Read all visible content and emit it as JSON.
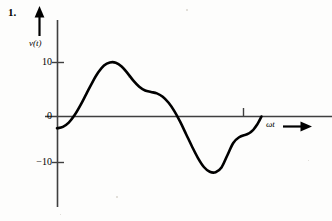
{
  "figure": {
    "problem_number": "1.",
    "y_axis_label": "v(t)",
    "x_axis_label": "ωt",
    "background_color": "#fdfdfc",
    "ink_color": "#000000",
    "axis_color": "#3a3a3a"
  },
  "ticks": {
    "y": [
      {
        "label": "10",
        "value": 10
      },
      {
        "label": "0",
        "value": 0
      },
      {
        "label": "−10",
        "value": -10
      }
    ],
    "x": [
      {
        "label": "",
        "value": 7.5
      }
    ]
  },
  "chart_data": {
    "type": "line",
    "title": "",
    "subtitle": "",
    "xlabel": "ωt",
    "ylabel": "v(t)",
    "xlim": [
      0,
      9.6
    ],
    "ylim": [
      -16,
      17
    ],
    "grid": false,
    "legend": null,
    "annotations": [
      {
        "text": "1.",
        "role": "problem-number"
      },
      {
        "text": "v(t)",
        "role": "y-axis-arrow-label"
      },
      {
        "text": "ωt",
        "role": "x-axis-arrow-label"
      }
    ],
    "yticks": [
      10,
      0,
      -10
    ],
    "ytick_labels": [
      "10",
      "0",
      "−10"
    ],
    "xticks": [
      7.5
    ],
    "xtick_labels": [
      ""
    ],
    "series": [
      {
        "name": "v(t)",
        "x": [
          0.0,
          0.25,
          0.5,
          0.75,
          1.0,
          1.25,
          1.5,
          1.75,
          2.0,
          2.25,
          2.5,
          2.75,
          3.0,
          3.25,
          3.5,
          3.75,
          4.0,
          4.25,
          4.5,
          4.75,
          5.0,
          5.25,
          5.5,
          5.75,
          6.0,
          6.25,
          6.5,
          6.75,
          7.0,
          7.25,
          7.5,
          7.75,
          8.0
        ],
        "y": [
          -2.5,
          -2.2,
          -1.3,
          0.3,
          2.4,
          4.8,
          7.2,
          9.3,
          10.8,
          11.45,
          11.4,
          10.6,
          9.2,
          7.6,
          6.3,
          5.5,
          5.2,
          4.9,
          4.2,
          2.9,
          1.1,
          -1.2,
          -3.8,
          -6.4,
          -8.8,
          -10.7,
          -11.7,
          -11.8,
          -10.8,
          -8.2,
          -5.6,
          -4.4,
          -3.9
        ],
        "color": "#000000",
        "linewidth": 2.6
      }
    ],
    "key_points": {
      "start": {
        "x": 0.0,
        "y": -2.5
      },
      "first_zero_crossing": {
        "x": 0.72,
        "y": 0
      },
      "positive_peak": {
        "x": 2.3,
        "y": 11.5
      },
      "shoulder": {
        "x": 4.1,
        "y": 5.1
      },
      "second_zero_crossing": {
        "x": 5.1,
        "y": 0
      },
      "negative_trough": {
        "x": 6.75,
        "y": -11.8
      },
      "secondary_shoulder": {
        "x": 8.0,
        "y": -3.9
      },
      "end_at_axis": {
        "x": 8.7,
        "y": 0
      }
    }
  }
}
